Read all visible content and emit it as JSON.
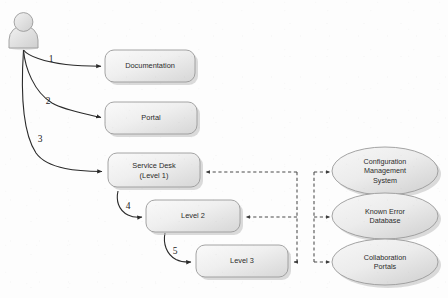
{
  "diagram": {
    "background_color": "#fdfdfd",
    "actor": {
      "name": "user-actor",
      "label": ""
    },
    "boxes": [
      {
        "id": "documentation",
        "label": "Documentation",
        "label_line2": ""
      },
      {
        "id": "portal",
        "label": "Portal",
        "label_line2": ""
      },
      {
        "id": "service-desk",
        "label": "Service Desk",
        "label_line2": "(Level 1)"
      },
      {
        "id": "level-2",
        "label": "Level 2",
        "label_line2": ""
      },
      {
        "id": "level-3",
        "label": "Level 3",
        "label_line2": ""
      }
    ],
    "ellipses": [
      {
        "id": "cms",
        "line1": "Configuration",
        "line2": "Management",
        "line3": "System"
      },
      {
        "id": "ked",
        "line1": "Known Error",
        "line2": "Database",
        "line3": ""
      },
      {
        "id": "collab",
        "line1": "Collaboration",
        "line2": "Portals",
        "line3": ""
      }
    ],
    "sequence_labels": [
      {
        "id": "step-1",
        "text": "1"
      },
      {
        "id": "step-2",
        "text": "2"
      },
      {
        "id": "step-3",
        "text": "3"
      },
      {
        "id": "step-4",
        "text": "4"
      },
      {
        "id": "step-5",
        "text": "5"
      }
    ],
    "colors": {
      "box_fill_light": "#f4f4f4",
      "box_fill_dark": "#d8d8d8",
      "ellipse_fill_light": "#f2f2f2",
      "ellipse_fill_dark": "#d5d5d5",
      "stroke": "#9a9a9a",
      "arrow": "#2a2a2a",
      "dashed": "#4a4a4a",
      "text": "#2b2b2b",
      "shadow": "#bdbdbd"
    }
  }
}
